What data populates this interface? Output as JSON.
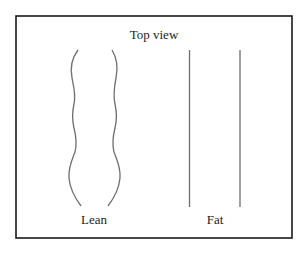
{
  "diagram": {
    "title": "Top view",
    "panels": [
      {
        "id": "lean",
        "label": "Lean",
        "outline": "wavy"
      },
      {
        "id": "fat",
        "label": "Fat",
        "outline": "straight"
      }
    ],
    "colors": {
      "frame": "#1a1a1a",
      "stroke": "#6e6e6e",
      "text": "#222222",
      "background": "#ffffff"
    }
  }
}
